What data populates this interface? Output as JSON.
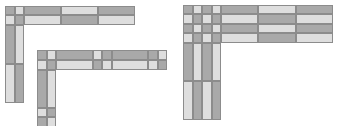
{
  "colors": {
    "dark": "#a9a9a9",
    "light": "#dedede",
    "border": "#8c8c8c",
    "background": "#ffffff"
  },
  "figures": [
    {
      "name": "figure-1-l-shape-two-strand",
      "cells": [
        {
          "x": 5,
          "y": 6,
          "w": 10,
          "h": 9,
          "t": "dark"
        },
        {
          "x": 15,
          "y": 6,
          "w": 9,
          "h": 9,
          "t": "light"
        },
        {
          "x": 24,
          "y": 6,
          "w": 37,
          "h": 9,
          "t": "dark"
        },
        {
          "x": 61,
          "y": 6,
          "w": 37,
          "h": 9,
          "t": "light"
        },
        {
          "x": 98,
          "y": 6,
          "w": 37,
          "h": 9,
          "t": "dark"
        },
        {
          "x": 5,
          "y": 15,
          "w": 10,
          "h": 10,
          "t": "light"
        },
        {
          "x": 15,
          "y": 15,
          "w": 9,
          "h": 10,
          "t": "dark"
        },
        {
          "x": 24,
          "y": 15,
          "w": 37,
          "h": 10,
          "t": "light"
        },
        {
          "x": 61,
          "y": 15,
          "w": 37,
          "h": 10,
          "t": "dark"
        },
        {
          "x": 98,
          "y": 15,
          "w": 37,
          "h": 10,
          "t": "light"
        },
        {
          "x": 5,
          "y": 25,
          "w": 10,
          "h": 39,
          "t": "dark"
        },
        {
          "x": 15,
          "y": 25,
          "w": 9,
          "h": 39,
          "t": "light"
        },
        {
          "x": 5,
          "y": 64,
          "w": 10,
          "h": 39,
          "t": "light"
        },
        {
          "x": 15,
          "y": 64,
          "w": 9,
          "h": 39,
          "t": "dark"
        }
      ]
    },
    {
      "name": "figure-2-l-shape-two-strand-with-crossings",
      "cells": [
        {
          "x": 37,
          "y": 50,
          "w": 10,
          "h": 10,
          "t": "dark"
        },
        {
          "x": 47,
          "y": 50,
          "w": 9,
          "h": 10,
          "t": "light"
        },
        {
          "x": 56,
          "y": 50,
          "w": 37,
          "h": 10,
          "t": "dark"
        },
        {
          "x": 93,
          "y": 50,
          "w": 9,
          "h": 10,
          "t": "light"
        },
        {
          "x": 102,
          "y": 50,
          "w": 10,
          "h": 10,
          "t": "dark"
        },
        {
          "x": 112,
          "y": 50,
          "w": 36,
          "h": 10,
          "t": "dark"
        },
        {
          "x": 148,
          "y": 50,
          "w": 10,
          "h": 10,
          "t": "dark"
        },
        {
          "x": 158,
          "y": 50,
          "w": 9,
          "h": 10,
          "t": "light"
        },
        {
          "x": 37,
          "y": 60,
          "w": 10,
          "h": 10,
          "t": "light"
        },
        {
          "x": 47,
          "y": 60,
          "w": 9,
          "h": 10,
          "t": "dark"
        },
        {
          "x": 56,
          "y": 60,
          "w": 37,
          "h": 10,
          "t": "light"
        },
        {
          "x": 93,
          "y": 60,
          "w": 9,
          "h": 10,
          "t": "dark"
        },
        {
          "x": 102,
          "y": 60,
          "w": 10,
          "h": 10,
          "t": "light"
        },
        {
          "x": 112,
          "y": 60,
          "w": 36,
          "h": 10,
          "t": "light"
        },
        {
          "x": 148,
          "y": 60,
          "w": 10,
          "h": 10,
          "t": "light"
        },
        {
          "x": 158,
          "y": 60,
          "w": 9,
          "h": 10,
          "t": "dark"
        },
        {
          "x": 37,
          "y": 70,
          "w": 10,
          "h": 38,
          "t": "dark"
        },
        {
          "x": 47,
          "y": 70,
          "w": 9,
          "h": 38,
          "t": "light"
        },
        {
          "x": 37,
          "y": 108,
          "w": 10,
          "h": 9,
          "t": "light"
        },
        {
          "x": 47,
          "y": 108,
          "w": 9,
          "h": 9,
          "t": "dark"
        },
        {
          "x": 37,
          "y": 117,
          "w": 10,
          "h": 10,
          "t": "dark"
        },
        {
          "x": 47,
          "y": 117,
          "w": 9,
          "h": 10,
          "t": "light"
        }
      ]
    },
    {
      "name": "figure-3-l-shape-four-strand",
      "cells": [
        {
          "x": 183,
          "y": 5,
          "w": 10,
          "h": 9,
          "t": "dark"
        },
        {
          "x": 193,
          "y": 5,
          "w": 9,
          "h": 9,
          "t": "light"
        },
        {
          "x": 202,
          "y": 5,
          "w": 10,
          "h": 9,
          "t": "dark"
        },
        {
          "x": 212,
          "y": 5,
          "w": 9,
          "h": 9,
          "t": "light"
        },
        {
          "x": 221,
          "y": 5,
          "w": 37,
          "h": 9,
          "t": "dark"
        },
        {
          "x": 258,
          "y": 5,
          "w": 38,
          "h": 9,
          "t": "light"
        },
        {
          "x": 296,
          "y": 5,
          "w": 37,
          "h": 9,
          "t": "dark"
        },
        {
          "x": 183,
          "y": 14,
          "w": 10,
          "h": 10,
          "t": "light"
        },
        {
          "x": 193,
          "y": 14,
          "w": 9,
          "h": 10,
          "t": "dark"
        },
        {
          "x": 202,
          "y": 14,
          "w": 10,
          "h": 10,
          "t": "light"
        },
        {
          "x": 212,
          "y": 14,
          "w": 9,
          "h": 10,
          "t": "dark"
        },
        {
          "x": 221,
          "y": 14,
          "w": 37,
          "h": 10,
          "t": "light"
        },
        {
          "x": 258,
          "y": 14,
          "w": 38,
          "h": 10,
          "t": "dark"
        },
        {
          "x": 296,
          "y": 14,
          "w": 37,
          "h": 10,
          "t": "light"
        },
        {
          "x": 183,
          "y": 24,
          "w": 10,
          "h": 9,
          "t": "dark"
        },
        {
          "x": 193,
          "y": 24,
          "w": 9,
          "h": 9,
          "t": "light"
        },
        {
          "x": 202,
          "y": 24,
          "w": 10,
          "h": 9,
          "t": "dark"
        },
        {
          "x": 212,
          "y": 24,
          "w": 9,
          "h": 9,
          "t": "light"
        },
        {
          "x": 221,
          "y": 24,
          "w": 37,
          "h": 9,
          "t": "dark"
        },
        {
          "x": 258,
          "y": 24,
          "w": 38,
          "h": 9,
          "t": "light"
        },
        {
          "x": 296,
          "y": 24,
          "w": 37,
          "h": 9,
          "t": "dark"
        },
        {
          "x": 183,
          "y": 33,
          "w": 10,
          "h": 10,
          "t": "light"
        },
        {
          "x": 193,
          "y": 33,
          "w": 9,
          "h": 10,
          "t": "dark"
        },
        {
          "x": 202,
          "y": 33,
          "w": 10,
          "h": 10,
          "t": "light"
        },
        {
          "x": 212,
          "y": 33,
          "w": 9,
          "h": 10,
          "t": "dark"
        },
        {
          "x": 221,
          "y": 33,
          "w": 37,
          "h": 10,
          "t": "light"
        },
        {
          "x": 258,
          "y": 33,
          "w": 38,
          "h": 10,
          "t": "dark"
        },
        {
          "x": 296,
          "y": 33,
          "w": 37,
          "h": 10,
          "t": "light"
        },
        {
          "x": 183,
          "y": 43,
          "w": 10,
          "h": 38,
          "t": "dark"
        },
        {
          "x": 193,
          "y": 43,
          "w": 9,
          "h": 38,
          "t": "light"
        },
        {
          "x": 202,
          "y": 43,
          "w": 10,
          "h": 38,
          "t": "dark"
        },
        {
          "x": 212,
          "y": 43,
          "w": 9,
          "h": 38,
          "t": "light"
        },
        {
          "x": 183,
          "y": 81,
          "w": 10,
          "h": 39,
          "t": "light"
        },
        {
          "x": 193,
          "y": 81,
          "w": 9,
          "h": 39,
          "t": "dark"
        },
        {
          "x": 202,
          "y": 81,
          "w": 10,
          "h": 39,
          "t": "light"
        },
        {
          "x": 212,
          "y": 81,
          "w": 9,
          "h": 39,
          "t": "dark"
        }
      ]
    }
  ]
}
